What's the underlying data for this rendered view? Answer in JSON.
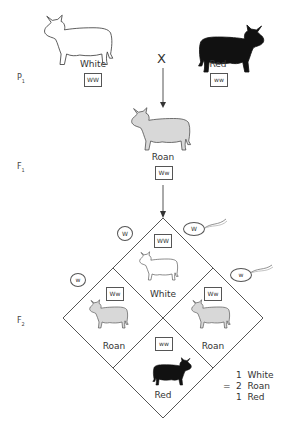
{
  "generations": {
    "p1": {
      "label": "P",
      "sub": "1"
    },
    "f1": {
      "label": "F",
      "sub": "1"
    },
    "f2": {
      "label": "F",
      "sub": "2"
    }
  },
  "parents": {
    "left": {
      "phenotype": "White",
      "genotype": "WW",
      "icon": "white-cow-icon"
    },
    "right": {
      "phenotype": "Red",
      "genotype": "ww",
      "icon": "red-cow-icon"
    },
    "cross_symbol": "X"
  },
  "f1": {
    "phenotype": "Roan",
    "genotype": "Ww",
    "icon": "roan-cow-icon"
  },
  "gametes": {
    "left_top": "W",
    "left_bottom": "w",
    "right_top": "W",
    "right_bottom": "w"
  },
  "punnett": {
    "top": {
      "phenotype": "White",
      "genotype": "WW"
    },
    "left": {
      "phenotype": "Roan",
      "genotype": "Ww"
    },
    "right": {
      "phenotype": "Roan",
      "genotype": "Ww"
    },
    "bottom": {
      "phenotype": "Red",
      "genotype": "ww"
    }
  },
  "ratio": {
    "equals": "=",
    "lines": [
      "1  White",
      "2  Roan",
      "1  Red"
    ]
  },
  "colors": {
    "white_cow": "#ffffff",
    "roan_cow": "#d8d8d8",
    "red_cow": "#111111",
    "line": "#555555"
  }
}
